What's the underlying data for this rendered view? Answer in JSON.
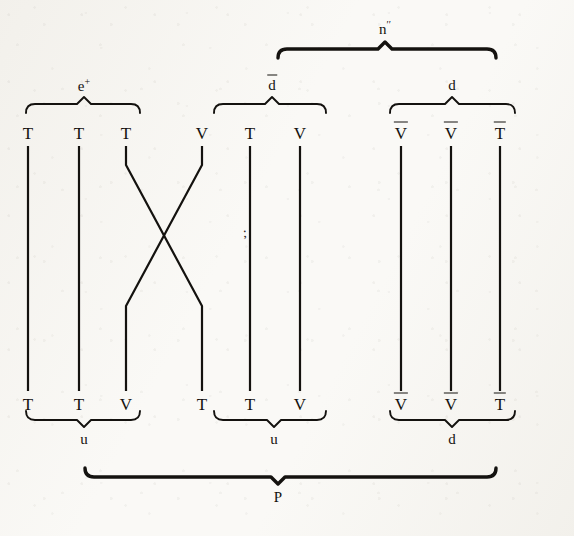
{
  "figure": {
    "kind": "particle-physics-quark-flow-diagram",
    "width": 574,
    "height": 536,
    "ink_color": "#14120f",
    "paper_color": "#faf9f6"
  },
  "columns": [
    {
      "id": "c1",
      "x": 28,
      "top_label": "T",
      "top_bar": false,
      "bottom_label": "T",
      "bottom_bar": false,
      "path": "straight"
    },
    {
      "id": "c2",
      "x": 79,
      "top_label": "T",
      "top_bar": false,
      "bottom_label": "T",
      "bottom_bar": false,
      "path": "straight"
    },
    {
      "id": "c3",
      "x": 126,
      "top_label": "T",
      "top_bar": false,
      "bottom_label": "V",
      "bottom_bar": false,
      "path": "cross-to-right"
    },
    {
      "id": "c4",
      "x": 202,
      "top_label": "V",
      "top_bar": false,
      "bottom_label": "T",
      "bottom_bar": false,
      "path": "cross-to-left"
    },
    {
      "id": "c5",
      "x": 250,
      "top_label": "T",
      "top_bar": false,
      "bottom_label": "T",
      "bottom_bar": false,
      "path": "straight"
    },
    {
      "id": "c6",
      "x": 300,
      "top_label": "V",
      "top_bar": false,
      "bottom_label": "V",
      "bottom_bar": false,
      "path": "straight"
    },
    {
      "id": "c7",
      "x": 401,
      "top_label": "V",
      "top_bar": true,
      "bottom_label": "V",
      "bottom_bar": true,
      "path": "straight"
    },
    {
      "id": "c8",
      "x": 451,
      "top_label": "V",
      "top_bar": true,
      "bottom_label": "V",
      "bottom_bar": true,
      "path": "straight"
    },
    {
      "id": "c9",
      "x": 500,
      "top_label": "T",
      "top_bar": true,
      "bottom_label": "T",
      "bottom_bar": true,
      "path": "straight"
    }
  ],
  "geometry": {
    "top_label_y": 133,
    "bottom_label_y": 404,
    "line_top_y": 146,
    "line_bottom_y": 391,
    "cross_start_y": 165,
    "cross_end_y": 306,
    "stroke_width": 2.2
  },
  "top_braces": [
    {
      "id": "brace-e-plus",
      "label_text": "e",
      "label_sup": "+",
      "label_overbar": false,
      "label_x": 84,
      "label_y": 85,
      "x1": 26,
      "x2": 140,
      "y": 104,
      "peak_x": 84,
      "weight": "thin"
    },
    {
      "id": "brace-d-bar",
      "label_text": "d",
      "label_sup": "",
      "label_overbar": true,
      "label_x": 272,
      "label_y": 85,
      "x1": 214,
      "x2": 326,
      "y": 104,
      "peak_x": 272,
      "weight": "thin"
    },
    {
      "id": "brace-d",
      "label_text": "d",
      "label_sup": "",
      "label_overbar": false,
      "label_x": 452,
      "label_y": 85,
      "x1": 390,
      "x2": 515,
      "y": 104,
      "peak_x": 452,
      "weight": "thin"
    },
    {
      "id": "brace-n-double-prime",
      "label_text": "n",
      "label_sup": "′′",
      "label_overbar": false,
      "label_x": 385,
      "label_y": 28,
      "x1": 278,
      "x2": 496,
      "y": 49,
      "peak_x": 385,
      "weight": "thick"
    }
  ],
  "bottom_braces": [
    {
      "id": "brace-u-left",
      "label_text": "u",
      "label_x": 84,
      "label_y": 439,
      "x1": 26,
      "x2": 140,
      "y": 420,
      "peak_x": 84,
      "weight": "thin"
    },
    {
      "id": "brace-u-middle",
      "label_text": "u",
      "label_x": 274,
      "label_y": 439,
      "x1": 214,
      "x2": 326,
      "y": 420,
      "peak_x": 274,
      "weight": "thin"
    },
    {
      "id": "brace-d-right",
      "label_text": "d",
      "label_x": 452,
      "label_y": 439,
      "x1": 390,
      "x2": 515,
      "y": 420,
      "peak_x": 452,
      "weight": "thin"
    },
    {
      "id": "brace-P",
      "label_text": "P",
      "label_x": 278,
      "label_y": 497,
      "x1": 85,
      "x2": 496,
      "y": 477,
      "peak_x": 278,
      "weight": "thick"
    }
  ],
  "stray_mark": {
    "text": ";",
    "x": 245,
    "y": 233
  }
}
